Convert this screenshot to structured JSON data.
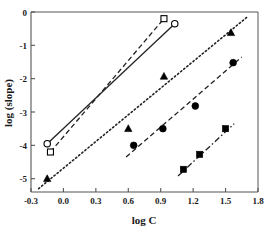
{
  "chart_data": {
    "type": "scatter",
    "title": "",
    "xlabel": "log C",
    "ylabel": "log (slope)",
    "xlim": [
      -0.3,
      1.8
    ],
    "ylim": [
      -5.4,
      0.0
    ],
    "xticks": [
      "-0.3",
      "0.0",
      "0.3",
      "0.6",
      "0.9",
      "1.2",
      "1.5",
      "1.8"
    ],
    "xtick_values": [
      -0.3,
      0.0,
      0.3,
      0.6,
      0.9,
      1.2,
      1.5,
      1.8
    ],
    "yticks": [
      "0",
      "-1",
      "-2",
      "-3",
      "-4",
      "-5"
    ],
    "ytick_values": [
      0,
      -1,
      -2,
      -3,
      -4,
      -5
    ],
    "grid": false,
    "legend": "none",
    "series": [
      {
        "name": "open-circle-series",
        "marker": "open-circle",
        "line": "solid",
        "points": [
          [
            -0.15,
            -3.95
          ],
          [
            1.03,
            -0.35
          ]
        ],
        "fit_line": [
          [
            -0.15,
            -3.95
          ],
          [
            1.03,
            -0.35
          ]
        ]
      },
      {
        "name": "open-square-series",
        "marker": "open-square",
        "line": "dashed",
        "points": [
          [
            -0.12,
            -4.2
          ],
          [
            0.93,
            -0.2
          ]
        ],
        "fit_line": [
          [
            -0.12,
            -4.2
          ],
          [
            0.93,
            -0.2
          ]
        ]
      },
      {
        "name": "filled-triangle-series",
        "marker": "filled-triangle",
        "line": "dotted",
        "points": [
          [
            -0.15,
            -5.0
          ],
          [
            0.6,
            -3.5
          ],
          [
            0.93,
            -1.93
          ],
          [
            1.55,
            -0.62
          ]
        ],
        "fit_line": [
          [
            -0.23,
            -5.3
          ],
          [
            1.7,
            -0.15
          ]
        ]
      },
      {
        "name": "filled-circle-series",
        "marker": "filled-circle",
        "line": "dashed",
        "points": [
          [
            0.65,
            -4.0
          ],
          [
            0.92,
            -3.5
          ],
          [
            1.22,
            -2.82
          ],
          [
            1.57,
            -1.52
          ]
        ],
        "fit_line": [
          [
            0.58,
            -4.35
          ],
          [
            1.65,
            -1.35
          ]
        ]
      },
      {
        "name": "filled-square-series",
        "marker": "filled-square",
        "line": "dash-dot",
        "points": [
          [
            1.11,
            -4.72
          ],
          [
            1.26,
            -4.27
          ],
          [
            1.5,
            -3.5
          ]
        ],
        "fit_line": [
          [
            1.06,
            -4.92
          ],
          [
            1.58,
            -3.35
          ]
        ]
      }
    ]
  },
  "axes": {
    "x_title": "log C",
    "y_title": "log (slope)"
  },
  "colors": {
    "axis": "#555555",
    "marker": "#000000",
    "line": "#222222",
    "background": "#ffffff"
  }
}
